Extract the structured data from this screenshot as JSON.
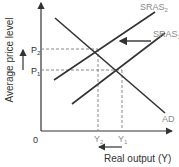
{
  "diagram": {
    "title": "",
    "y_axis_label": "Average price level",
    "x_axis_label": "Real output (Y)",
    "origin_label": "0",
    "price_levels": [
      {
        "id": "p2",
        "label": "P",
        "sub": "2"
      },
      {
        "id": "p1",
        "label": "P",
        "sub": "1"
      }
    ],
    "output_levels": [
      {
        "id": "y2",
        "label": "Y",
        "sub": "2"
      },
      {
        "id": "y1",
        "label": "Y",
        "sub": "1"
      }
    ],
    "curves": [
      {
        "id": "sras2",
        "label": "SRAS",
        "sub": "2"
      },
      {
        "id": "sras1",
        "label": "SRAS",
        "sub": "1"
      },
      {
        "id": "ad",
        "label": "AD"
      }
    ],
    "arrows": [
      {
        "id": "shift-arrow",
        "meaning": "SRAS shifts left from SRAS1 to SRAS2"
      },
      {
        "id": "price-up-arrow",
        "meaning": "price level rises"
      },
      {
        "id": "output-down-arrow",
        "meaning": "output falls"
      }
    ],
    "colors": {
      "line": "#333333",
      "dashed": "#888888",
      "label_grey": "#8a8a8a"
    }
  }
}
